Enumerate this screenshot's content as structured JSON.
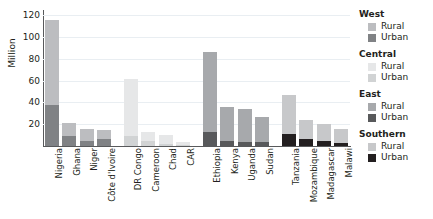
{
  "chart_data": {
    "type": "bar",
    "subtype": "stacked-bar-grouped",
    "title": "",
    "xlabel": "",
    "ylabel": "Million",
    "ylim": [
      0,
      125
    ],
    "yticks": [
      20,
      40,
      60,
      80,
      100,
      120
    ],
    "grid": true,
    "legend_position": "right",
    "stack_order": [
      "Urban",
      "Rural"
    ],
    "categories": [
      "Nigeria",
      "Ghana",
      "Niger",
      "Côte d'Ivoire",
      "DR Congo",
      "Cameroon",
      "Chad",
      "CAR",
      "Ethiopia",
      "Kenya",
      "Uganda",
      "Sudan",
      "Tanzania",
      "Mozambique",
      "Madagascar",
      "Malawi"
    ],
    "groups": [
      {
        "region": "West",
        "rural_color": "#bcbdc0",
        "urban_color": "#808285",
        "countries": [
          {
            "name": "Nigeria",
            "urban": 38,
            "rural": 78,
            "total": 116
          },
          {
            "name": "Ghana",
            "urban": 9,
            "rural": 12,
            "total": 21
          },
          {
            "name": "Niger",
            "urban": 5,
            "rural": 11,
            "total": 16
          },
          {
            "name": "Côte d'Ivoire",
            "urban": 6,
            "rural": 9,
            "total": 15
          }
        ]
      },
      {
        "region": "Central",
        "rural_color": "#e6e7e8",
        "urban_color": "#d1d3d4",
        "countries": [
          {
            "name": "DR Congo",
            "urban": 9,
            "rural": 53,
            "total": 62
          },
          {
            "name": "Cameroon",
            "urban": 5,
            "rural": 8,
            "total": 13
          },
          {
            "name": "Chad",
            "urban": 2,
            "rural": 8,
            "total": 10
          },
          {
            "name": "CAR",
            "urban": 1,
            "rural": 3,
            "total": 4
          }
        ]
      },
      {
        "region": "East",
        "rural_color": "#a7a9ac",
        "urban_color": "#58595b",
        "countries": [
          {
            "name": "Ethiopia",
            "urban": 13,
            "rural": 73,
            "total": 86
          },
          {
            "name": "Kenya",
            "urban": 5,
            "rural": 31,
            "total": 36
          },
          {
            "name": "Uganda",
            "urban": 4,
            "rural": 30,
            "total": 34
          },
          {
            "name": "Sudan",
            "urban": 4,
            "rural": 23,
            "total": 27
          }
        ]
      },
      {
        "region": "Southern",
        "rural_color": "#c7c8ca",
        "urban_color": "#231f20",
        "countries": [
          {
            "name": "Tanzania",
            "urban": 11,
            "rural": 36,
            "total": 47
          },
          {
            "name": "Mozambique",
            "urban": 6,
            "rural": 18,
            "total": 24
          },
          {
            "name": "Madagascar",
            "urban": 5,
            "rural": 15,
            "total": 20
          },
          {
            "name": "Malawi",
            "urban": 3,
            "rural": 13,
            "total": 16
          }
        ]
      }
    ],
    "series": [
      {
        "name": "Urban",
        "values": [
          38,
          9,
          5,
          6,
          9,
          5,
          2,
          1,
          13,
          5,
          4,
          4,
          11,
          6,
          5,
          3
        ]
      },
      {
        "name": "Rural",
        "values": [
          78,
          12,
          11,
          9,
          53,
          8,
          8,
          3,
          73,
          31,
          30,
          23,
          36,
          18,
          15,
          13
        ]
      }
    ]
  },
  "legend": {
    "groups": [
      {
        "title": "West",
        "rows": [
          {
            "label": "Rural",
            "color": "#bcbdc0"
          },
          {
            "label": "Urban",
            "color": "#808285"
          }
        ]
      },
      {
        "title": "Central",
        "rows": [
          {
            "label": "Rural",
            "color": "#e6e7e8"
          },
          {
            "label": "Urban",
            "color": "#d1d3d4"
          }
        ]
      },
      {
        "title": "East",
        "rows": [
          {
            "label": "Rural",
            "color": "#a7a9ac"
          },
          {
            "label": "Urban",
            "color": "#58595b"
          }
        ]
      },
      {
        "title": "Southern",
        "rows": [
          {
            "label": "Rural",
            "color": "#c7c8ca"
          },
          {
            "label": "Urban",
            "color": "#231f20"
          }
        ]
      }
    ]
  }
}
